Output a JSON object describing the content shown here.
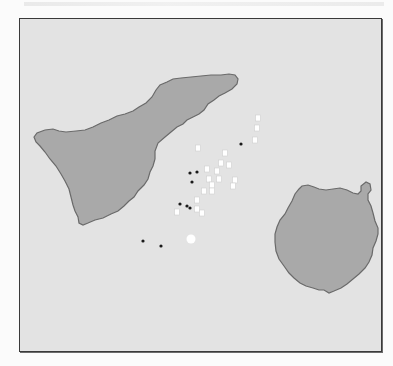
{
  "map": {
    "sea_color": "#e3e3e3",
    "land_color": "#a9a9a9",
    "coast_color": "#6a6a6a",
    "frame_color": "#3a3a3a",
    "islands": [
      {
        "id": "tenerife",
        "shape": "large triangular island, top-left"
      },
      {
        "id": "gran-canaria",
        "shape": "round island, right"
      }
    ],
    "markers": {
      "black_dots": [
        [
          189,
          172
        ],
        [
          196,
          171
        ],
        [
          191,
          181
        ],
        [
          179,
          203
        ],
        [
          186,
          205
        ],
        [
          189,
          207
        ],
        [
          142,
          240
        ],
        [
          160,
          245
        ],
        [
          240,
          143
        ]
      ],
      "white_squares": [
        [
          197,
          147
        ],
        [
          206,
          168
        ],
        [
          216,
          170
        ],
        [
          208,
          178
        ],
        [
          218,
          178
        ],
        [
          211,
          184
        ],
        [
          203,
          190
        ],
        [
          211,
          190
        ],
        [
          196,
          199
        ],
        [
          220,
          162
        ],
        [
          228,
          164
        ],
        [
          224,
          152
        ],
        [
          196,
          208
        ],
        [
          176,
          211
        ],
        [
          201,
          212
        ],
        [
          234,
          179
        ],
        [
          232,
          185
        ],
        [
          257,
          117
        ],
        [
          256,
          127
        ],
        [
          254,
          139
        ]
      ],
      "white_circle": [
        190,
        238
      ]
    }
  }
}
